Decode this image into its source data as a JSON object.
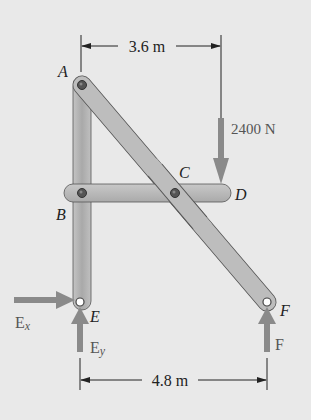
{
  "figure": {
    "type": "frame-statics-diagram",
    "colors": {
      "background": "#e9e9e9",
      "member_fill": "#b9b9b9",
      "member_stroke": "#555555",
      "arrow": "#8a8a8a",
      "dim_line": "#222222",
      "text": "#222222",
      "label_gray": "#555555"
    },
    "points": {
      "A": {
        "label": "A"
      },
      "B": {
        "label": "B"
      },
      "C": {
        "label": "C"
      },
      "D": {
        "label": "D"
      },
      "E": {
        "label": "E"
      },
      "F": {
        "label": "F"
      }
    },
    "members": [
      "AE",
      "AF",
      "BD"
    ],
    "loads": {
      "applied": {
        "label": "2400 N",
        "direction": "down",
        "at": "D"
      },
      "Ex": {
        "label_main": "E",
        "label_sub": "x",
        "direction": "right",
        "at": "E"
      },
      "Ey": {
        "label_main": "E",
        "label_sub": "y",
        "direction": "up",
        "at": "E"
      },
      "F": {
        "label": "F",
        "direction": "up",
        "at": "F"
      }
    },
    "dimensions": {
      "top": {
        "label": "3.6 m",
        "from": "A",
        "to": "load line"
      },
      "bottom": {
        "label": "4.8 m",
        "from": "E",
        "to": "F"
      }
    }
  }
}
